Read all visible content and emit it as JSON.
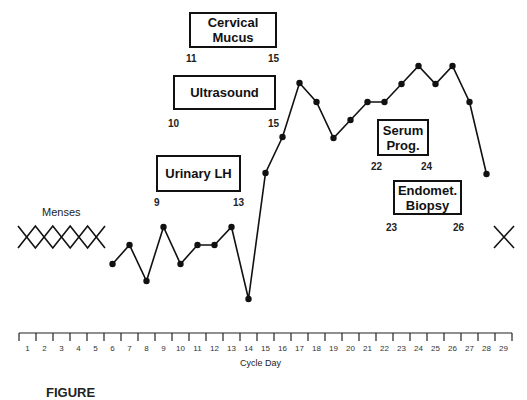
{
  "chart_data": {
    "type": "line",
    "title": "",
    "xlabel": "Cycle Day",
    "ylabel": "",
    "x": [
      6,
      7,
      8,
      9,
      10,
      11,
      12,
      13,
      14,
      15,
      16,
      17,
      18,
      19,
      20,
      21,
      22,
      23,
      24,
      25,
      26,
      27,
      28
    ],
    "series": [
      {
        "name": "Basal body temperature",
        "pixel_y": [
          264,
          245,
          281,
          227,
          264,
          245,
          245,
          227,
          299,
          173,
          137,
          83,
          102,
          138,
          120,
          102,
          102,
          84,
          66,
          84,
          66,
          102,
          174
        ],
        "relative_values": [
          2,
          3,
          1,
          4,
          2,
          3,
          3,
          4,
          0,
          7,
          9,
          12,
          11,
          9,
          10,
          11,
          11,
          12,
          13,
          12,
          13,
          11,
          7
        ]
      }
    ],
    "x_ticks": [
      "1",
      "2",
      "3",
      "4",
      "5",
      "6",
      "7",
      "8",
      "9",
      "10",
      "11",
      "12",
      "13",
      "14",
      "15",
      "16",
      "17",
      "18",
      "19",
      "20",
      "21",
      "22",
      "23",
      "24",
      "25",
      "26",
      "27",
      "28",
      "29"
    ],
    "xlim": [
      1,
      29
    ],
    "grid": false,
    "annotations": [
      {
        "label": "Cervical Mucus",
        "start_day": "11",
        "end_day": "15"
      },
      {
        "label": "Ultrasound",
        "start_day": "10",
        "end_day": "15"
      },
      {
        "label": "Urinary LH",
        "start_day": "9",
        "end_day": "13"
      },
      {
        "label": "Serum Prog.",
        "start_day": "22",
        "end_day": "24"
      },
      {
        "label": "Endomet. Biopsy",
        "start_day": "23",
        "end_day": "26"
      }
    ],
    "menses": {
      "label": "Menses",
      "days": [
        1,
        2,
        3,
        4,
        5
      ],
      "next_start_day": 29
    }
  },
  "boxes": {
    "cervical": {
      "line1": "Cervical",
      "line2": "Mucus",
      "start": "11",
      "end": "15"
    },
    "ultrasound": {
      "line1": "Ultrasound",
      "start": "10",
      "end": "15"
    },
    "lh": {
      "line1": "Urinary LH",
      "start": "9",
      "end": "13"
    },
    "serum": {
      "line1": "Serum",
      "line2": "Prog.",
      "start": "22",
      "end": "24"
    },
    "biopsy": {
      "line1": "Endomet.",
      "line2": "Biopsy",
      "start": "23",
      "end": "26"
    }
  },
  "menses_label": "Menses",
  "axis": {
    "title": "Cycle Day",
    "ticks": [
      "1",
      "2",
      "3",
      "4",
      "5",
      "6",
      "7",
      "8",
      "9",
      "10",
      "11",
      "12",
      "13",
      "14",
      "15",
      "16",
      "17",
      "18",
      "19",
      "20",
      "21",
      "22",
      "23",
      "24",
      "25",
      "26",
      "27",
      "28",
      "29"
    ]
  },
  "caption_partial": "FIGURE"
}
